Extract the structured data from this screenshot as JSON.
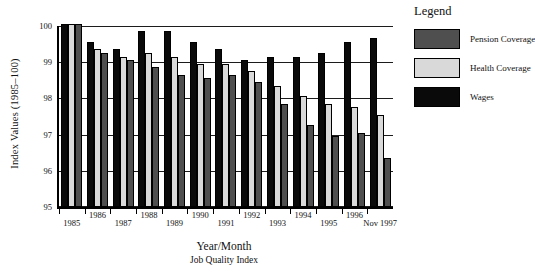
{
  "chart_data": {
    "type": "bar",
    "title": "",
    "categories": [
      "1985",
      "1986",
      "1987",
      "1988",
      "1989",
      "1990",
      "1991",
      "1992",
      "1993",
      "1994",
      "1995",
      "1996",
      "Nov 1997"
    ],
    "series": [
      {
        "name": "Wages",
        "color": "#0a0a0a",
        "values": [
          100,
          99.5,
          99.3,
          99.8,
          99.8,
          99.5,
          99.3,
          99.0,
          99.1,
          99.1,
          99.2,
          99.5,
          99.6
        ]
      },
      {
        "name": "Health Coverage",
        "color": "#d9d9d9",
        "values": [
          100,
          99.3,
          99.1,
          99.2,
          99.1,
          98.9,
          98.9,
          98.7,
          98.3,
          98.0,
          97.8,
          97.7,
          97.5
        ]
      },
      {
        "name": "Pension Coverage",
        "color": "#4f4f4f",
        "values": [
          100,
          99.2,
          99.0,
          98.8,
          98.6,
          98.5,
          98.6,
          98.4,
          97.8,
          97.2,
          96.9,
          97.0,
          96.3
        ]
      }
    ],
    "ylabel": "Index Values (1985–100)",
    "xlabel": "Year/Month",
    "xlabel_sub": "Job Quality Index",
    "ylim": [
      95,
      100
    ],
    "yticks": [
      100,
      99,
      98,
      97,
      96,
      95
    ],
    "grid": "horizontal",
    "legend": {
      "title": "Legend",
      "position": "right",
      "items": [
        {
          "label": "Pension Coverage",
          "color": "#4f4f4f"
        },
        {
          "label": "Health Coverage",
          "color": "#d9d9d9"
        },
        {
          "label": "Wages",
          "color": "#0a0a0a"
        }
      ]
    }
  }
}
